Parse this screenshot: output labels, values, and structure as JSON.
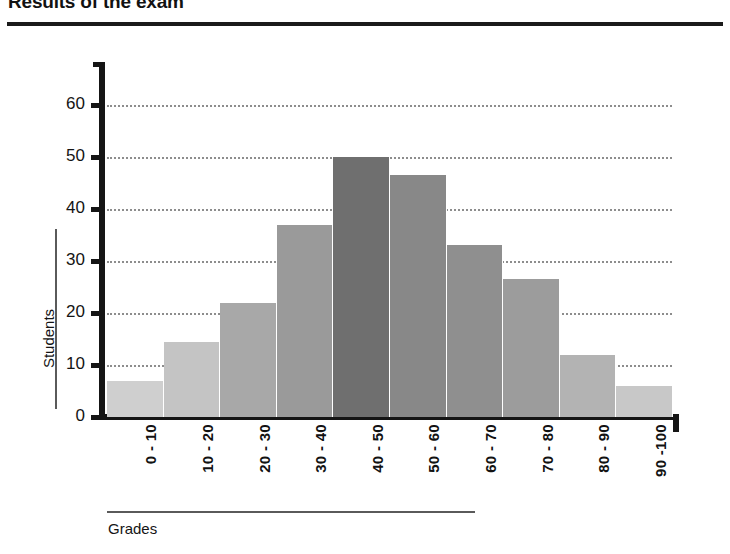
{
  "chart_data": {
    "type": "bar",
    "title": "Results of the exam",
    "xlabel": "Grades",
    "ylabel": "Students",
    "categories": [
      "0 - 10",
      "10 - 20",
      "20 - 30",
      "30 - 40",
      "40 - 50",
      "50 - 60",
      "60 - 70",
      "70 - 80",
      "80 - 90",
      "90 -100"
    ],
    "values": [
      7,
      14.5,
      22,
      37,
      50,
      46.5,
      33,
      26.5,
      12,
      6
    ],
    "bar_colors": [
      "#cfcfcf",
      "#c4c4c4",
      "#a8a8a8",
      "#9a9a9a",
      "#6f6f6f",
      "#888888",
      "#8f8f8f",
      "#9c9c9c",
      "#b3b3b3",
      "#c8c8c8"
    ],
    "ylim": [
      0,
      65
    ],
    "yticks": [
      0,
      10,
      20,
      30,
      40,
      50,
      60
    ],
    "ytick_labels": [
      "0",
      "10",
      "20",
      "30",
      "40",
      "50",
      "60"
    ],
    "grid": true,
    "gridlines_at": [
      10,
      20,
      30,
      40,
      50,
      60
    ],
    "legend": null,
    "xtick_rotation": 90
  },
  "axis": {
    "axis_color": "#151515",
    "grid_color": "#8d8d8d"
  }
}
